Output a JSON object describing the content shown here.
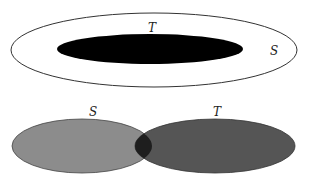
{
  "diagram": {
    "top": {
      "description": "T is a subset of S",
      "outer_label": "S",
      "inner_label": "T",
      "colors": {
        "outer_fill": "#ffffff",
        "outer_stroke": "#333333",
        "inner_fill": "#000000"
      }
    },
    "bottom": {
      "description": "S and T overlap",
      "left_label": "S",
      "right_label": "T",
      "colors": {
        "left_fill": "#8c8c8c",
        "right_fill": "#555555",
        "overlap_fill": "#1e1e1e",
        "stroke": "#333333"
      }
    }
  }
}
